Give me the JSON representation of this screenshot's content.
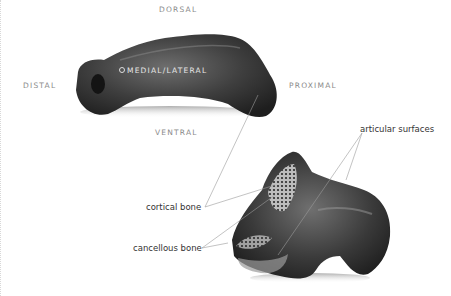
{
  "orientation_labels": {
    "dorsal": "DORSAL",
    "ventral": "VENTRAL",
    "distal": "DISTAL",
    "proximal": "PROXIMAL",
    "medial_lateral": "MEDIAL/LATERAL"
  },
  "callouts": {
    "articular_surfaces": "articular surfaces",
    "cortical_bone": "cortical bone",
    "cancellous_bone": "cancellous bone"
  },
  "images": {
    "top_bone": "phalanx-lateral-view",
    "bottom_bone": "phalanx-proximal-end-view"
  }
}
